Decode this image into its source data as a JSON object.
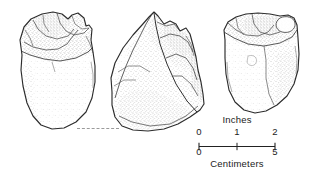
{
  "figure": {
    "type": "archaeological-line-drawing",
    "views": [
      {
        "name": "left-view",
        "label": ""
      },
      {
        "name": "middle-view",
        "label": ""
      },
      {
        "name": "right-view",
        "label": ""
      }
    ],
    "baseline": {
      "style": "dashed",
      "color": "#9a9a9a"
    }
  },
  "scalebar": {
    "top_unit_label": "Inches",
    "bottom_unit_label": "Centimeters",
    "inch_ticks": [
      "0",
      "1",
      "2"
    ],
    "cm_ticks": [
      "0",
      "5"
    ],
    "line_color": "#222222"
  },
  "colors": {
    "background": "#ffffff",
    "ink": "#222222",
    "stipple": "#6f6f6f",
    "dash": "#9a9a9a"
  }
}
